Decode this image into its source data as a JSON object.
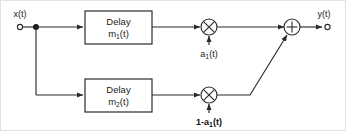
{
  "diagram": {
    "colors": {
      "wire": "#2b2b2b",
      "text": "#1a1a1a",
      "background": "#ffffff",
      "frame": "#e2e2e2"
    },
    "input": {
      "label": "x(t)",
      "terminal": "open-circle"
    },
    "output": {
      "label": "y(t)",
      "terminal": "open-circle"
    },
    "blocks": [
      {
        "id": "delay-1",
        "line1": "Delay",
        "line2_base": "m",
        "line2_sub": "1",
        "line2_tail": "(t)"
      },
      {
        "id": "delay-2",
        "line1": "Delay",
        "line2_base": "m",
        "line2_sub": "2",
        "line2_tail": "(t)"
      }
    ],
    "multipliers": [
      {
        "id": "multiplier-top",
        "glyph": "cross",
        "gain_prefix": "a",
        "gain_sub": "1",
        "gain_tail": "(t)"
      },
      {
        "id": "multiplier-bottom",
        "glyph": "cross",
        "gain_prefix": "1-a",
        "gain_sub": "1",
        "gain_tail": "(t)"
      }
    ],
    "adder": {
      "id": "summing-junction",
      "glyph": "plus"
    },
    "junction": {
      "id": "input-split",
      "type": "filled-dot"
    }
  }
}
